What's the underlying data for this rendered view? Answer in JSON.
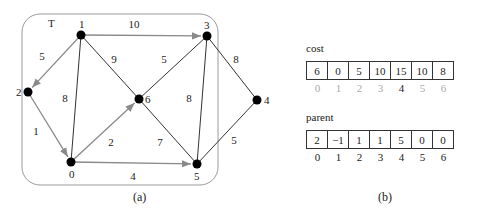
{
  "figure": {
    "panel_a": {
      "caption": "(a)",
      "tree_label": "T",
      "nodes": [
        {
          "id": "0",
          "x": 71,
          "y": 162,
          "label_dx": -2,
          "label_dy": 16
        },
        {
          "id": "1",
          "x": 81,
          "y": 35,
          "label_dx": -2,
          "label_dy": -7
        },
        {
          "id": "2",
          "x": 28,
          "y": 92,
          "label_dx": -12,
          "label_dy": 4
        },
        {
          "id": "3",
          "x": 207,
          "y": 36,
          "label_dx": -3,
          "label_dy": -7
        },
        {
          "id": "4",
          "x": 257,
          "y": 100,
          "label_dx": 7,
          "label_dy": 4
        },
        {
          "id": "5",
          "x": 197,
          "y": 164,
          "label_dx": -3,
          "label_dy": 16
        },
        {
          "id": "6",
          "x": 139,
          "y": 99,
          "label_dx": 6,
          "label_dy": 4
        }
      ],
      "edges": [
        {
          "from": "1",
          "to": "2",
          "weight": "5",
          "tree": true,
          "lx": 42,
          "ly": 60
        },
        {
          "from": "2",
          "to": "0",
          "weight": "1",
          "tree": true,
          "lx": 36,
          "ly": 135
        },
        {
          "from": "0",
          "to": "6",
          "weight": "2",
          "tree": true,
          "lx": 111,
          "ly": 146
        },
        {
          "from": "0",
          "to": "5",
          "weight": "4",
          "tree": true,
          "lx": 133,
          "ly": 180
        },
        {
          "from": "1",
          "to": "3",
          "weight": "10",
          "tree": true,
          "lx": 134,
          "ly": 28
        },
        {
          "from": "1",
          "to": "0",
          "weight": "8",
          "tree": false,
          "lx": 65,
          "ly": 102
        },
        {
          "from": "1",
          "to": "6",
          "weight": "9",
          "tree": false,
          "lx": 114,
          "ly": 63
        },
        {
          "from": "6",
          "to": "3",
          "weight": "5",
          "tree": false,
          "lx": 164,
          "ly": 63
        },
        {
          "from": "6",
          "to": "5",
          "weight": "7",
          "tree": false,
          "lx": 160,
          "ly": 146
        },
        {
          "from": "3",
          "to": "5",
          "weight": "8",
          "tree": false,
          "lx": 189,
          "ly": 102
        },
        {
          "from": "3",
          "to": "4",
          "weight": "8",
          "tree": false,
          "lx": 236,
          "ly": 63
        },
        {
          "from": "4",
          "to": "5",
          "weight": "5",
          "tree": false,
          "lx": 234,
          "ly": 144
        }
      ],
      "colors": {
        "tree_edge": "#8a8a8a",
        "graph_edge": "#333333",
        "node": "#000000",
        "box": "#9a9a9a"
      }
    },
    "panel_b": {
      "caption": "(b)",
      "cost": {
        "title": "cost",
        "values": [
          "6",
          "0",
          "5",
          "10",
          "15",
          "10",
          "8"
        ],
        "indices": [
          "0",
          "1",
          "2",
          "3",
          "4",
          "5",
          "6"
        ],
        "highlighted_index": "4"
      },
      "parent": {
        "title": "parent",
        "values": [
          "2",
          "−1",
          "1",
          "1",
          "5",
          "0",
          "0"
        ],
        "indices": [
          "0",
          "1",
          "2",
          "3",
          "4",
          "5",
          "6"
        ]
      }
    }
  }
}
